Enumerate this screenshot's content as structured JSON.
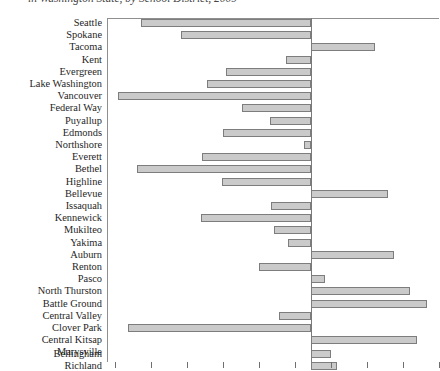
{
  "chart": {
    "title": "in Washington State, by School District, 2009",
    "bar_fill_color": "#cacaca",
    "bar_border_color": "#7d7d7d",
    "axis_color": "#8f8f8f"
  },
  "chart_data": {
    "type": "bar",
    "orientation": "horizontal",
    "title": "in Washington State, by School District, 2009",
    "xlabel": "",
    "ylabel": "",
    "grid": false,
    "legend": null,
    "zero_baseline": true,
    "note": "Diverging horizontal bar chart; values are in pixel-derived units relative to the zero baseline (negative = bar extends left, positive = bar extends right). Axis tick labels are cropped out of the screenshot.",
    "axis_ticks_px": [
      115,
      151,
      187,
      223,
      259,
      295,
      311,
      331,
      367,
      403,
      439
    ],
    "categories": [
      "Seattle",
      "Spokane",
      "Tacoma",
      "Kent",
      "Evergreen",
      "Lake Washington",
      "Vancouver",
      "Federal Way",
      "Puyallup",
      "Edmonds",
      "Northshore",
      "Everett",
      "Bethel",
      "Highline",
      "Bellevue",
      "Issaquah",
      "Kennewick",
      "Mukilteo",
      "Yakima",
      "Auburn",
      "Renton",
      "Pasco",
      "North Thurston",
      "Battle Ground",
      "Central Valley",
      "Clover Park",
      "Central Kitsap",
      "Marysville",
      "Bellingham",
      "Richland"
    ],
    "values": [
      -47.2,
      -36.1,
      17.8,
      -6.9,
      -23.6,
      -28.9,
      -53.6,
      -19.2,
      -11.4,
      -24.4,
      -1.9,
      -30.3,
      -48.3,
      -24.7,
      21.4,
      -11.1,
      -30.6,
      -10.3,
      -6.4,
      23.1,
      -14.4,
      3.9,
      27.5,
      32.2,
      -8.9,
      -51.1,
      29.4,
      0.0,
      5.6,
      7.2
    ]
  },
  "bars_px": [
    {
      "label": "Seattle",
      "left": 141,
      "right": 311,
      "top": 19
    },
    {
      "label": "Spokane",
      "left": 181,
      "right": 311,
      "top": 31
    },
    {
      "label": "Tacoma",
      "left": 311,
      "right": 375,
      "top": 43
    },
    {
      "label": "Kent",
      "left": 286,
      "right": 311,
      "top": 56
    },
    {
      "label": "Evergreen",
      "left": 226,
      "right": 311,
      "top": 68
    },
    {
      "label": "Lake Washington",
      "left": 207,
      "right": 311,
      "top": 80
    },
    {
      "label": "Vancouver",
      "left": 118,
      "right": 311,
      "top": 92
    },
    {
      "label": "Federal Way",
      "left": 242,
      "right": 311,
      "top": 104
    },
    {
      "label": "Puyallup",
      "left": 270,
      "right": 311,
      "top": 117
    },
    {
      "label": "Edmonds",
      "left": 223,
      "right": 311,
      "top": 129
    },
    {
      "label": "Northshore",
      "left": 304,
      "right": 311,
      "top": 141
    },
    {
      "label": "Everett",
      "left": 202,
      "right": 311,
      "top": 153
    },
    {
      "label": "Bethel",
      "left": 137,
      "right": 311,
      "top": 165
    },
    {
      "label": "Highline",
      "left": 222,
      "right": 311,
      "top": 178
    },
    {
      "label": "Bellevue",
      "left": 311,
      "right": 388,
      "top": 190
    },
    {
      "label": "Issaquah",
      "left": 271,
      "right": 311,
      "top": 202
    },
    {
      "label": "Kennewick",
      "left": 201,
      "right": 311,
      "top": 214
    },
    {
      "label": "Mukilteo",
      "left": 274,
      "right": 311,
      "top": 226
    },
    {
      "label": "Yakima",
      "left": 288,
      "right": 311,
      "top": 239
    },
    {
      "label": "Auburn",
      "left": 311,
      "right": 394,
      "top": 251
    },
    {
      "label": "Renton",
      "left": 259,
      "right": 311,
      "top": 263
    },
    {
      "label": "Pasco",
      "left": 311,
      "right": 325,
      "top": 275
    },
    {
      "label": "North Thurston",
      "left": 311,
      "right": 410,
      "top": 287
    },
    {
      "label": "Battle Ground",
      "left": 311,
      "right": 427,
      "top": 300
    },
    {
      "label": "Central Valley",
      "left": 279,
      "right": 311,
      "top": 312
    },
    {
      "label": "Clover Park",
      "left": 128,
      "right": 311,
      "top": 324
    },
    {
      "label": "Central Kitsap",
      "left": 311,
      "right": 417,
      "top": 336
    },
    {
      "label": "Marysville",
      "left": 311,
      "right": 311,
      "top": 348
    },
    {
      "label": "Bellingham",
      "left": 311,
      "right": 331,
      "top": 350
    },
    {
      "label": "Richland",
      "left": 311,
      "right": 337,
      "top": 362
    }
  ],
  "label_positions_px": [
    {
      "text": "Seattle",
      "top": 17
    },
    {
      "text": "Spokane",
      "top": 29
    },
    {
      "text": "Tacoma",
      "top": 41
    },
    {
      "text": "Kent",
      "top": 54
    },
    {
      "text": "Evergreen",
      "top": 66
    },
    {
      "text": "Lake Washington",
      "top": 78
    },
    {
      "text": "Vancouver",
      "top": 90
    },
    {
      "text": "Federal Way",
      "top": 102
    },
    {
      "text": "Puyallup",
      "top": 115
    },
    {
      "text": "Edmonds",
      "top": 127
    },
    {
      "text": "Northshore",
      "top": 139
    },
    {
      "text": "Everett",
      "top": 151
    },
    {
      "text": "Bethel",
      "top": 163
    },
    {
      "text": "Highline",
      "top": 176
    },
    {
      "text": "Bellevue",
      "top": 188
    },
    {
      "text": "Issaquah",
      "top": 200
    },
    {
      "text": "Kennewick",
      "top": 212
    },
    {
      "text": "Mukilteo",
      "top": 224
    },
    {
      "text": "Yakima",
      "top": 237
    },
    {
      "text": "Auburn",
      "top": 249
    },
    {
      "text": "Renton",
      "top": 261
    },
    {
      "text": "Pasco",
      "top": 273
    },
    {
      "text": "North Thurston",
      "top": 285
    },
    {
      "text": "Battle Ground",
      "top": 298
    },
    {
      "text": "Central Valley",
      "top": 310
    },
    {
      "text": "Clover Park",
      "top": 322
    },
    {
      "text": "Central Kitsap",
      "top": 334
    },
    {
      "text": "Marysville",
      "top": 346
    },
    {
      "text": "Bellingham",
      "top": 348
    },
    {
      "text": "Richland",
      "top": 360
    }
  ]
}
